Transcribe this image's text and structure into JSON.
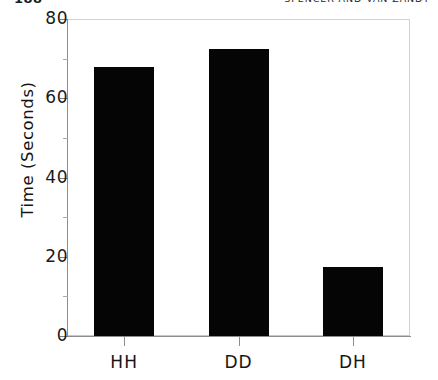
{
  "page": {
    "page_number": "188",
    "running_title": "SPENCER AND VAN ZANDT"
  },
  "chart_data": {
    "type": "bar",
    "title": "",
    "xlabel": "",
    "ylabel": "Time (Seconds)",
    "categories": [
      "HH",
      "DD",
      "DH"
    ],
    "values": [
      68,
      72.5,
      17.5
    ],
    "ylim": [
      0,
      80
    ],
    "y_ticks_major": [
      0,
      20,
      40,
      60,
      80
    ],
    "y_tick_labels": [
      "0",
      "20",
      "40",
      "60",
      "80"
    ],
    "y_ticks_minor": [
      10,
      30,
      50,
      70
    ],
    "grid": false,
    "legend": "none",
    "bar_color": "#050505",
    "axis_color": "#8d8d8d"
  }
}
